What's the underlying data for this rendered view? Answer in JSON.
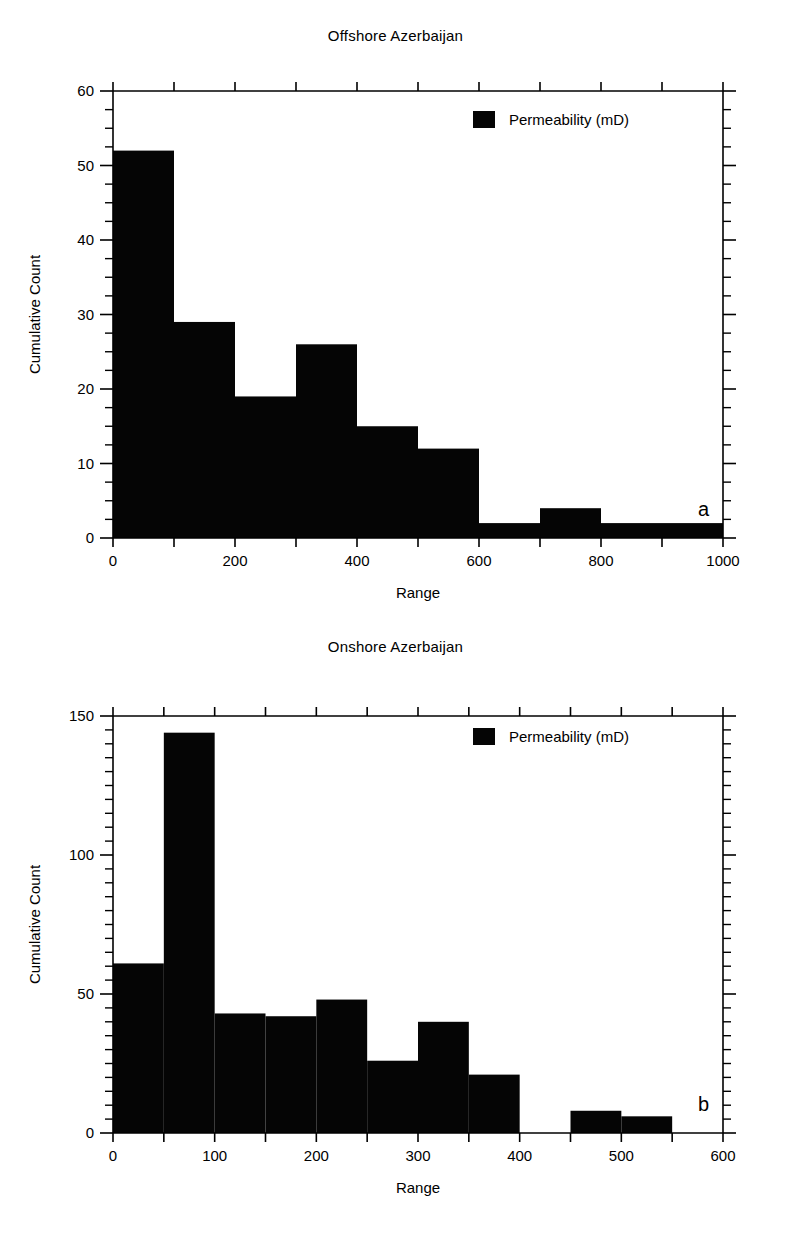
{
  "page": {
    "background_color": "#ffffff",
    "foreground_color": "#000000"
  },
  "figures": [
    {
      "panel_letter": "a",
      "title": "Offshore Azerbaijan",
      "xlabel": "Range",
      "ylabel": "Cumulative Count",
      "legend_label": "Permeability (mD)"
    },
    {
      "panel_letter": "b",
      "title": "Onshore Azerbaijan",
      "xlabel": "Range",
      "ylabel": "Cumulative Count",
      "legend_label": "Permeability (mD)"
    }
  ],
  "chart_data": [
    {
      "type": "bar",
      "id": "offshore-azerbaijan",
      "panel": "a",
      "title": "Offshore Azerbaijan",
      "xlabel": "Range",
      "ylabel": "Cumulative Count",
      "legend": [
        "Permeability (mD)"
      ],
      "legend_position": "top-right-inside",
      "grid": false,
      "series_color": "#050505",
      "xlim": [
        0,
        1000
      ],
      "ylim": [
        0,
        60
      ],
      "x_major_ticks": [
        0,
        100,
        200,
        300,
        400,
        500,
        600,
        700,
        800,
        900,
        1000
      ],
      "x_tick_labels": [
        "0",
        "",
        "200",
        "",
        "400",
        "",
        "600",
        "",
        "800",
        "",
        "1000"
      ],
      "x_labeled_ticks": [
        0,
        200,
        400,
        600,
        800,
        1000
      ],
      "y_major_ticks": [
        0,
        10,
        20,
        30,
        40,
        50,
        60
      ],
      "y_tick_labels": [
        "0",
        "10",
        "20",
        "30",
        "40",
        "50",
        "60"
      ],
      "y_minor_step": 2.5,
      "bin_width": 100,
      "bin_edges": [
        0,
        100,
        200,
        300,
        400,
        500,
        600,
        700,
        800,
        900,
        1000
      ],
      "categories": [
        "0-100",
        "100-200",
        "200-300",
        "300-400",
        "400-500",
        "500-600",
        "600-700",
        "700-800",
        "800-900",
        "900-1000"
      ],
      "values": [
        52,
        29,
        19,
        26,
        15,
        12,
        2,
        4,
        2,
        2
      ]
    },
    {
      "type": "bar",
      "id": "onshore-azerbaijan",
      "panel": "b",
      "title": "Onshore Azerbaijan",
      "xlabel": "Range",
      "ylabel": "Cumulative Count",
      "legend": [
        "Permeability (mD)"
      ],
      "legend_position": "top-right-inside",
      "grid": false,
      "series_color": "#050505",
      "xlim": [
        0,
        600
      ],
      "ylim": [
        0,
        150
      ],
      "x_major_ticks": [
        0,
        50,
        100,
        150,
        200,
        250,
        300,
        350,
        400,
        450,
        500,
        550,
        600
      ],
      "x_tick_labels": [
        "0",
        "",
        "100",
        "",
        "200",
        "",
        "300",
        "",
        "400",
        "",
        "500",
        "",
        "600"
      ],
      "x_labeled_ticks": [
        0,
        100,
        200,
        300,
        400,
        500,
        600
      ],
      "y_major_ticks": [
        0,
        50,
        100,
        150
      ],
      "y_tick_labels": [
        "0",
        "50",
        "100",
        "150"
      ],
      "y_minor_step": 5,
      "bin_width": 50,
      "bin_edges": [
        0,
        50,
        100,
        150,
        200,
        250,
        300,
        350,
        400,
        450,
        500,
        550,
        600
      ],
      "categories": [
        "0-50",
        "50-100",
        "100-150",
        "150-200",
        "200-250",
        "250-300",
        "300-350",
        "350-400",
        "400-450",
        "450-500",
        "500-550",
        "550-600"
      ],
      "values": [
        61,
        144,
        43,
        42,
        48,
        26,
        40,
        21,
        0,
        8,
        6,
        0
      ]
    }
  ]
}
